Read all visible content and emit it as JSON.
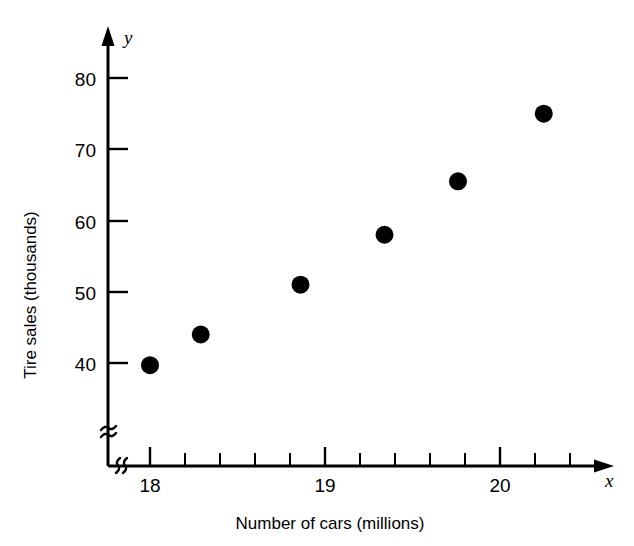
{
  "chart_data": {
    "type": "scatter",
    "title": "",
    "xlabel": "Number of cars (millions)",
    "ylabel": "Tire sales (thousands)",
    "x_var_symbol": "x",
    "y_var_symbol": "y",
    "xlim": [
      17.72,
      20.72
    ],
    "ylim": [
      36.0,
      82.0
    ],
    "x_axis_broken": true,
    "y_axis_broken": true,
    "grid": false,
    "legend": null,
    "x_major_ticks": [
      18,
      19,
      20
    ],
    "x_major_tick_labels": [
      "18",
      "19",
      "20"
    ],
    "x_minor_tick_step": 0.2,
    "y_major_ticks": [
      40,
      50,
      60,
      70,
      80
    ],
    "y_major_tick_labels": [
      "40",
      "50",
      "60",
      "70",
      "80"
    ],
    "marker": {
      "shape": "circle",
      "color": "#000000",
      "radius_px": 9
    },
    "points": [
      {
        "x": 18.0,
        "y": 39.7
      },
      {
        "x": 18.29,
        "y": 44.0
      },
      {
        "x": 18.86,
        "y": 51.0
      },
      {
        "x": 19.34,
        "y": 58.0
      },
      {
        "x": 19.76,
        "y": 65.5
      },
      {
        "x": 20.25,
        "y": 75.0
      }
    ],
    "x": [
      18.0,
      18.29,
      18.86,
      19.34,
      19.76,
      20.25
    ],
    "values": [
      39.7,
      44.0,
      51.0,
      58.0,
      65.5,
      75.0
    ],
    "axis_color": "#000000",
    "background_color": "#ffffff"
  }
}
